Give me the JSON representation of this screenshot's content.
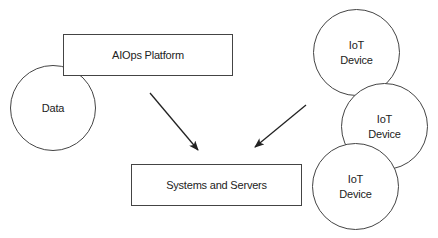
{
  "diagram": {
    "nodes": {
      "aiops": {
        "label": "AIOps Platform"
      },
      "data": {
        "label": "Data"
      },
      "systems": {
        "label": "Systems and Servers"
      },
      "iot1": {
        "line1": "IoT",
        "line2": "Device"
      },
      "iot2": {
        "line1": "IoT",
        "line2": "Device"
      },
      "iot3": {
        "line1": "IoT",
        "line2": "Device"
      }
    },
    "edges": [
      {
        "from": "AIOps Platform",
        "to": "Systems and Servers"
      },
      {
        "from": "IoT Device",
        "to": "Systems and Servers"
      }
    ],
    "colors": {
      "stroke": "#444444",
      "arrow": "#222222",
      "text": "#222222",
      "background": "#ffffff"
    }
  }
}
